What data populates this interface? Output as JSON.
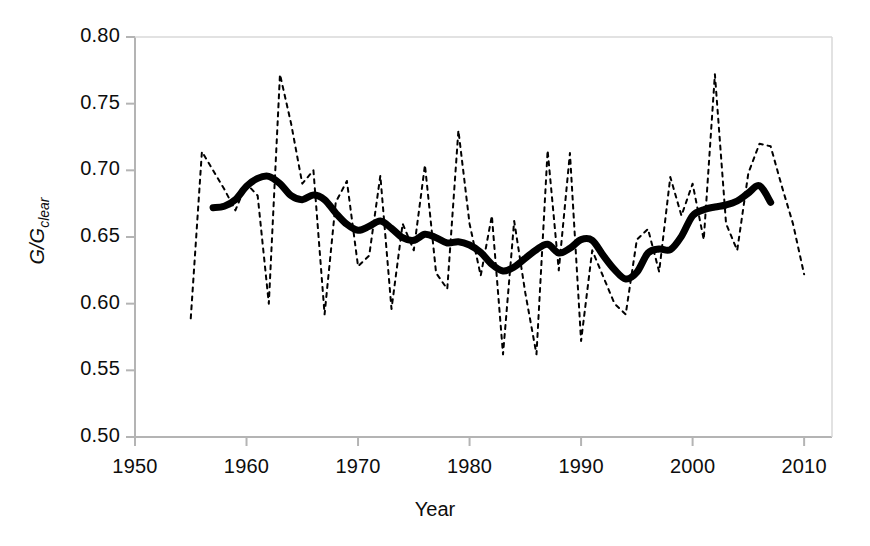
{
  "chart_data": {
    "type": "line",
    "title": "",
    "xlabel": "Year",
    "ylabel": "G/G clear",
    "ylabel_main": "G/G",
    "ylabel_sub": "clear",
    "xlim": [
      1950,
      2012.5
    ],
    "ylim": [
      0.5,
      0.8
    ],
    "xticks": [
      1950,
      1960,
      1970,
      1980,
      1990,
      2000,
      2010
    ],
    "xtick_labels": [
      "1950",
      "1960",
      "1970",
      "1980",
      "1990",
      "2000",
      "2010"
    ],
    "yticks": [
      0.5,
      0.55,
      0.6,
      0.65,
      0.7,
      0.75,
      0.8
    ],
    "ytick_labels": [
      "0.50",
      "0.55",
      "0.60",
      "0.65",
      "0.70",
      "0.75",
      "0.80"
    ],
    "grid": false,
    "legend": "none",
    "axis_color": "#b4b4b4",
    "series": [
      {
        "name": "annual",
        "style": "dashed",
        "color": "#000000",
        "width": 2,
        "x": [
          1955,
          1956,
          1957,
          1958,
          1959,
          1960,
          1961,
          1962,
          1963,
          1964,
          1965,
          1966,
          1967,
          1968,
          1969,
          1970,
          1971,
          1972,
          1973,
          1974,
          1975,
          1976,
          1977,
          1978,
          1979,
          1980,
          1981,
          1982,
          1983,
          1984,
          1985,
          1986,
          1987,
          1988,
          1989,
          1990,
          1991,
          1992,
          1993,
          1994,
          1995,
          1996,
          1997,
          1998,
          1999,
          2000,
          2001,
          2002,
          2003,
          2004,
          2005,
          2006,
          2007,
          2008,
          2009,
          2010
        ],
        "values": [
          0.589,
          0.714,
          0.7,
          0.686,
          0.67,
          0.69,
          0.681,
          0.6,
          0.772,
          0.735,
          0.69,
          0.7,
          0.592,
          0.676,
          0.692,
          0.628,
          0.636,
          0.696,
          0.596,
          0.66,
          0.64,
          0.704,
          0.623,
          0.611,
          0.73,
          0.66,
          0.621,
          0.666,
          0.562,
          0.662,
          0.608,
          0.562,
          0.715,
          0.625,
          0.713,
          0.572,
          0.64,
          0.62,
          0.6,
          0.592,
          0.648,
          0.656,
          0.624,
          0.695,
          0.666,
          0.69,
          0.648,
          0.772,
          0.66,
          0.64,
          0.698,
          0.72,
          0.718,
          0.688,
          0.66,
          0.622
        ]
      },
      {
        "name": "smoothed",
        "style": "solid",
        "color": "#000000",
        "width": 7,
        "x": [
          1957,
          1958,
          1959,
          1960,
          1961,
          1962,
          1963,
          1964,
          1965,
          1966,
          1967,
          1968,
          1969,
          1970,
          1971,
          1972,
          1973,
          1974,
          1975,
          1976,
          1977,
          1978,
          1979,
          1980,
          1981,
          1982,
          1983,
          1984,
          1985,
          1986,
          1987,
          1988,
          1989,
          1990,
          1991,
          1992,
          1993,
          1994,
          1995,
          1996,
          1997,
          1998,
          1999,
          2000,
          2001,
          2002,
          2003,
          2004,
          2005,
          2006,
          2007
        ],
        "values": [
          0.672,
          0.673,
          0.678,
          0.688,
          0.694,
          0.6955,
          0.69,
          0.681,
          0.678,
          0.6815,
          0.678,
          0.668,
          0.6595,
          0.655,
          0.658,
          0.662,
          0.6565,
          0.6495,
          0.6475,
          0.652,
          0.6495,
          0.6455,
          0.6465,
          0.644,
          0.6385,
          0.6295,
          0.6245,
          0.6275,
          0.634,
          0.6405,
          0.6445,
          0.638,
          0.6415,
          0.648,
          0.6475,
          0.636,
          0.6255,
          0.6185,
          0.6235,
          0.638,
          0.641,
          0.6405,
          0.6505,
          0.666,
          0.6705,
          0.6725,
          0.674,
          0.677,
          0.683,
          0.6885,
          0.676
        ]
      }
    ]
  }
}
